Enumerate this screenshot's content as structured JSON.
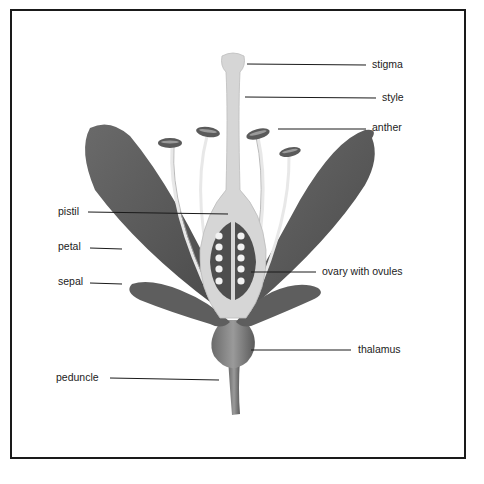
{
  "diagram": {
    "labels": {
      "stigma": "stigma",
      "style": "style",
      "anther": "anther",
      "pistil": "pistil",
      "petal": "petal",
      "sepal": "sepal",
      "ovary": "ovary with ovules",
      "thalamus": "thalamus",
      "peduncle": "peduncle"
    },
    "colors": {
      "petal": "#5a5a5a",
      "pistil": "#d4d4d4",
      "ovary": "#4e4e4e",
      "ovule": "#f2f2f2",
      "line": "#1a1a1a"
    }
  }
}
